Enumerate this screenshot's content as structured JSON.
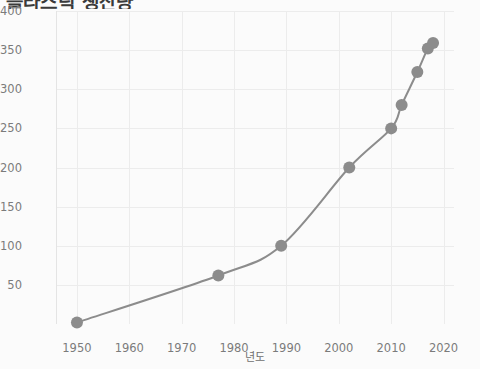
{
  "chart_data": {
    "type": "line",
    "title": "플라스틱 생산량",
    "xlabel": "년도",
    "ylabel": "플라스틱 생산량(톤 단위)",
    "xlim": [
      1946,
      2022
    ],
    "ylim": [
      0,
      400
    ],
    "grid": true,
    "legend": "none",
    "line_color": "#8c8c8c",
    "marker_color": "#8c8c8c",
    "grid_color": "#ececec",
    "text_color": "#7b7b7b",
    "background_color": "#fbfbfb",
    "xticks": [
      "1950",
      "1960",
      "1970",
      "1980",
      "1990",
      "2000",
      "2010",
      "2020"
    ],
    "xtick_values": [
      1950,
      1960,
      1970,
      1980,
      1990,
      2000,
      2010,
      2020
    ],
    "yticks": [
      "50",
      "100",
      "150",
      "200",
      "250",
      "300",
      "350",
      "400"
    ],
    "ytick_values": [
      50,
      100,
      150,
      200,
      250,
      300,
      350,
      400
    ],
    "series": [
      {
        "name": "플라스틱 생산량",
        "x": [
          1950,
          1977,
          1989,
          2002,
          2010,
          2012,
          2015,
          2017,
          2018
        ],
        "values": [
          2,
          62,
          100,
          200,
          250,
          280,
          322,
          352,
          359
        ]
      }
    ]
  }
}
